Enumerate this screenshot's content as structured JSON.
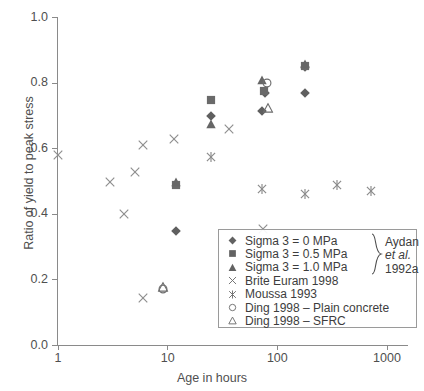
{
  "chart_data": {
    "type": "scatter",
    "title": "",
    "xlabel": "Age in hours",
    "ylabel": "Ratio of yield to peak stress",
    "xscale": "log",
    "xlim": [
      1,
      1000
    ],
    "ylim": [
      0.0,
      1.0
    ],
    "xticks": [
      "1",
      "10",
      "100",
      "1000"
    ],
    "xtick_values": [
      1,
      10,
      100,
      1000
    ],
    "yticks": [
      "0.0",
      "0.2",
      "0.4",
      "0.6",
      "0.8",
      "1.0"
    ],
    "ytick_values": [
      0.0,
      0.2,
      0.4,
      0.6,
      0.8,
      1.0
    ],
    "grid": false,
    "legend_position": "lower right",
    "series": [
      {
        "name": "Sigma 3 = 0 MPa",
        "marker": "filled-diamond",
        "color": "#5f5f5f",
        "points": [
          {
            "x": 12,
            "y": 0.35
          },
          {
            "x": 25,
            "y": 0.7
          },
          {
            "x": 72,
            "y": 0.715
          },
          {
            "x": 78,
            "y": 0.77
          },
          {
            "x": 180,
            "y": 0.77
          },
          {
            "x": 180,
            "y": 0.85
          }
        ]
      },
      {
        "name": "Sigma 3 = 0.5 MPa",
        "marker": "filled-square",
        "color": "#6a6a6a",
        "points": [
          {
            "x": 12,
            "y": 0.49
          },
          {
            "x": 25,
            "y": 0.75
          },
          {
            "x": 75,
            "y": 0.775
          },
          {
            "x": 180,
            "y": 0.852
          }
        ]
      },
      {
        "name": "Sigma 3 = 1.0 MPa",
        "marker": "filled-triangle",
        "color": "#666666",
        "points": [
          {
            "x": 12,
            "y": 0.5
          },
          {
            "x": 25,
            "y": 0.675
          },
          {
            "x": 72,
            "y": 0.808
          },
          {
            "x": 180,
            "y": 0.857
          }
        ]
      },
      {
        "name": "Brite Euram 1998",
        "marker": "cross-x",
        "color": "#8e8e8e",
        "points": [
          {
            "x": 1,
            "y": 0.58
          },
          {
            "x": 3,
            "y": 0.5
          },
          {
            "x": 4,
            "y": 0.4
          },
          {
            "x": 5,
            "y": 0.53
          },
          {
            "x": 6,
            "y": 0.61
          },
          {
            "x": 6,
            "y": 0.145
          },
          {
            "x": 11.5,
            "y": 0.63
          },
          {
            "x": 36,
            "y": 0.66
          },
          {
            "x": 74,
            "y": 0.355
          }
        ]
      },
      {
        "name": "Moussa 1993",
        "marker": "asterisk",
        "color": "#8a8a8a",
        "points": [
          {
            "x": 25,
            "y": 0.575
          },
          {
            "x": 72,
            "y": 0.478
          },
          {
            "x": 180,
            "y": 0.462
          },
          {
            "x": 350,
            "y": 0.49
          },
          {
            "x": 720,
            "y": 0.472
          }
        ]
      },
      {
        "name": "Ding 1998 – Plain concrete",
        "marker": "open-circle",
        "color": "#6e6e6e",
        "points": [
          {
            "x": 9,
            "y": 0.172
          },
          {
            "x": 80,
            "y": 0.8
          }
        ]
      },
      {
        "name": "Ding 1998 – SFRC",
        "marker": "open-triangle",
        "color": "#6e6e6e",
        "points": [
          {
            "x": 9,
            "y": 0.178
          },
          {
            "x": 82,
            "y": 0.725
          }
        ]
      }
    ]
  },
  "axes": {
    "x_title": "Age in hours",
    "y_title": "Ratio of yield to peak stress",
    "x_tick_labels": [
      "1",
      "10",
      "100",
      "1000"
    ],
    "y_tick_labels": [
      "0.0",
      "0.2",
      "0.4",
      "0.6",
      "0.8",
      "1.0"
    ]
  },
  "legend": {
    "entries": [
      {
        "label": "Sigma 3 = 0 MPa",
        "marker": "filled-diamond"
      },
      {
        "label": "Sigma 3 = 0.5 MPa",
        "marker": "filled-square"
      },
      {
        "label": "Sigma 3 = 1.0 MPa",
        "marker": "filled-triangle"
      },
      {
        "label": "Brite Euram 1998",
        "marker": "cross-x"
      },
      {
        "label": "Moussa 1993",
        "marker": "asterisk"
      },
      {
        "label": "Ding 1998 – Plain concrete",
        "marker": "open-circle"
      },
      {
        "label": "Ding 1998 – SFRC",
        "marker": "open-triangle"
      }
    ],
    "group_label_lines": [
      "Aydan",
      "et al.",
      "1992a"
    ],
    "group_label_italic_index": 1
  },
  "colors": {
    "axis": "#8a8a8a",
    "text": "#4f4f4f",
    "marker_filled": "#626262",
    "marker_open": "#6e6e6e",
    "legend_border": "#9a9a9a",
    "background": "#ffffff"
  }
}
